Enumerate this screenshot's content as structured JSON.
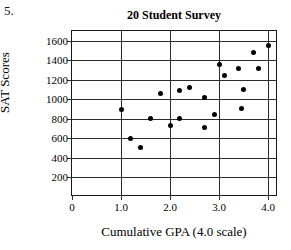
{
  "question_number": "5.",
  "chart_data": {
    "type": "scatter",
    "title": "20 Student Survey",
    "xlabel": "Cumulative GPA (4.0 scale)",
    "ylabel": "SAT Scores",
    "xlim": [
      0,
      4.2
    ],
    "ylim": [
      0,
      1700
    ],
    "xticks": [
      0,
      1.0,
      2.0,
      3.0,
      4.0
    ],
    "xtick_labels": [
      "0",
      "1.0",
      "2.0",
      "3.0",
      "4.0"
    ],
    "yticks": [
      200,
      400,
      600,
      800,
      1000,
      1200,
      1400,
      1600
    ],
    "ytick_labels": [
      "200",
      "400",
      "600",
      "800",
      "1000",
      "1200",
      "1400",
      "1600"
    ],
    "grid": "horizontal-and-vertical",
    "legend": "none",
    "points": [
      {
        "x": 1.0,
        "y": 900
      },
      {
        "x": 1.2,
        "y": 600
      },
      {
        "x": 1.4,
        "y": 510
      },
      {
        "x": 1.6,
        "y": 800
      },
      {
        "x": 1.8,
        "y": 1060
      },
      {
        "x": 2.0,
        "y": 730
      },
      {
        "x": 2.2,
        "y": 1090
      },
      {
        "x": 2.2,
        "y": 800
      },
      {
        "x": 2.4,
        "y": 1120
      },
      {
        "x": 2.7,
        "y": 1020
      },
      {
        "x": 2.7,
        "y": 710
      },
      {
        "x": 2.9,
        "y": 850
      },
      {
        "x": 3.0,
        "y": 1360
      },
      {
        "x": 3.1,
        "y": 1240
      },
      {
        "x": 3.4,
        "y": 1320
      },
      {
        "x": 3.45,
        "y": 910
      },
      {
        "x": 3.5,
        "y": 1100
      },
      {
        "x": 3.7,
        "y": 1480
      },
      {
        "x": 3.8,
        "y": 1320
      },
      {
        "x": 4.0,
        "y": 1550
      }
    ]
  }
}
